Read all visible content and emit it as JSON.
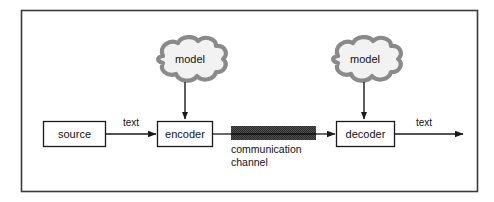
{
  "figure": {
    "border_color": "#3a3a3a",
    "background": "#ffffff"
  },
  "nodes": {
    "source": {
      "label": "source",
      "x": 43,
      "y": 121,
      "w": 63,
      "h": 26
    },
    "encoder": {
      "label": "encoder",
      "x": 157,
      "y": 121,
      "w": 56,
      "h": 26
    },
    "decoder": {
      "label": "decoder",
      "x": 336,
      "y": 121,
      "w": 59,
      "h": 26
    }
  },
  "clouds": [
    {
      "label": "model",
      "name": "encoder-model-cloud",
      "cx": 186,
      "cy": 62
    },
    {
      "label": "model",
      "name": "decoder-model-cloud",
      "cx": 361,
      "cy": 62
    }
  ],
  "channel": {
    "line1": "communication",
    "line2": "channel",
    "fill": "#4a4a4a",
    "x": 231,
    "y": 126,
    "w": 85,
    "h": 14
  },
  "edges": {
    "source_to_encoder": {
      "label": "text"
    },
    "encoder_to_channel": {
      "label": ""
    },
    "channel_to_decoder": {
      "label": ""
    },
    "decoder_out": {
      "label": "text"
    },
    "cloud_to_encoder": {
      "label": ""
    },
    "cloud_to_decoder": {
      "label": ""
    }
  },
  "colors": {
    "stroke": "#1a1a1a",
    "cloud_outline": "#8a8a8a",
    "cloud_fill": "#f2f2f2",
    "box_fill": "#ffffff"
  }
}
